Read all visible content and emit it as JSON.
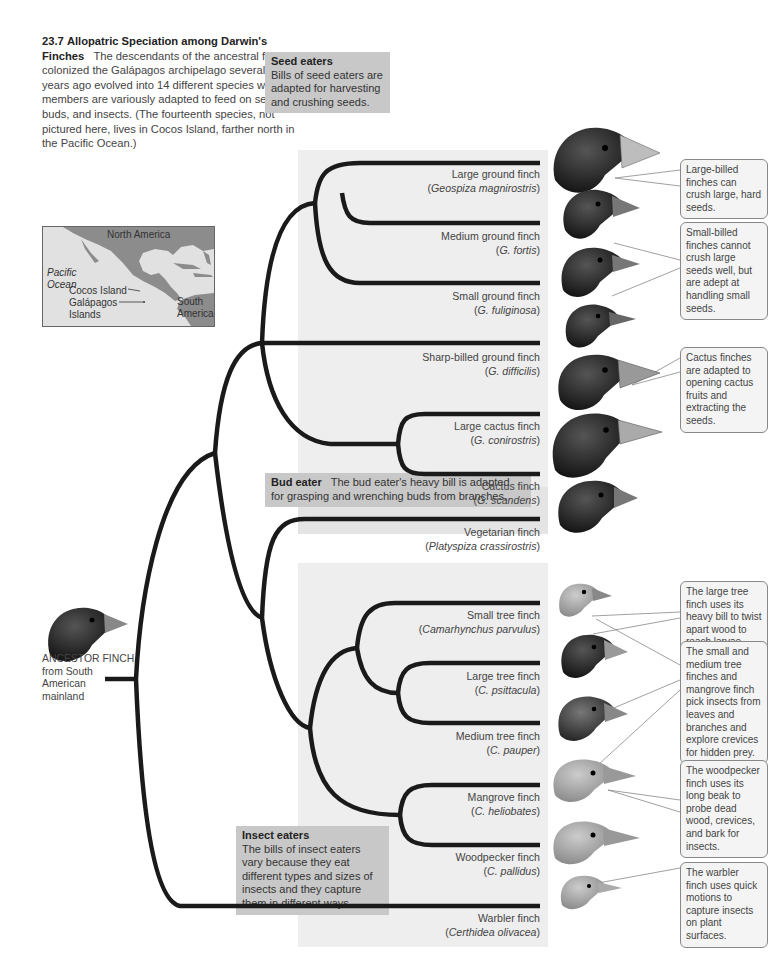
{
  "figure": {
    "number": "23.7",
    "title": "Allopatric Speciation among Darwin's Finches",
    "caption": "The descendants of the ancestral finch that colonized the Galápagos archipelago several million years ago evolved into 14 different species whose members are variously adapted to feed on seeds, buds, and insects. (The fourteenth species, not pictured here, lives in Cocos Island, farther north in the Pacific Ocean.)"
  },
  "map": {
    "labels": {
      "north_america": "North America",
      "pacific_ocean_1": "Pacific",
      "pacific_ocean_2": "Ocean",
      "cocos_island": "Cocos Island",
      "galapagos_1": "Galápagos",
      "galapagos_2": "Islands",
      "south_america_1": "South",
      "south_america_2": "America"
    },
    "colors": {
      "land": "#8c8c8c",
      "water": "#e1e1e1"
    }
  },
  "groups": {
    "seed_eaters": {
      "title": "Seed eaters",
      "text": "Bills of seed eaters are adapted for harvesting and crushing seeds."
    },
    "bud_eater": {
      "title": "Bud eater",
      "text": "The bud eater's heavy bill is adapted for grasping and wrenching buds from branches."
    },
    "insect_eaters": {
      "title": "Insect eaters",
      "text": "The bills of insect eaters vary because they eat different types and sizes of insects and they capture them in different ways."
    }
  },
  "ancestor": {
    "line1": "ANCESTOR FINCH",
    "line2": "from South",
    "line3": "American",
    "line4": "mainland"
  },
  "species": [
    {
      "common": "Large ground finch",
      "scientific": "Geospiza magnirostris",
      "diet": "seed"
    },
    {
      "common": "Medium ground finch",
      "scientific": "G. fortis",
      "diet": "seed"
    },
    {
      "common": "Small ground finch",
      "scientific": "G. fuliginosa",
      "diet": "seed"
    },
    {
      "common": "Sharp-billed ground finch",
      "scientific": "G. difficilis",
      "diet": "seed"
    },
    {
      "common": "Large cactus finch",
      "scientific": "G. conirostris",
      "diet": "seed"
    },
    {
      "common": "Cactus finch",
      "scientific": "G. scandens",
      "diet": "seed"
    },
    {
      "common": "Vegetarian finch",
      "scientific": "Platyspiza crassirostris",
      "diet": "bud"
    },
    {
      "common": "Small tree finch",
      "scientific": "Camarhynchus parvulus",
      "diet": "insect"
    },
    {
      "common": "Large tree finch",
      "scientific": "C. psittacula",
      "diet": "insect"
    },
    {
      "common": "Medium tree finch",
      "scientific": "C. pauper",
      "diet": "insect"
    },
    {
      "common": "Mangrove finch",
      "scientific": "C. heliobates",
      "diet": "insect"
    },
    {
      "common": "Woodpecker finch",
      "scientific": "C. pallidus",
      "diet": "insect"
    },
    {
      "common": "Warbler finch",
      "scientific": "Certhidea olivacea",
      "diet": "insect"
    }
  ],
  "notes": [
    {
      "text": "Large-billed finches can crush large, hard seeds."
    },
    {
      "text": "Small-billed finches cannot crush large seeds well, but are adept at handling small seeds."
    },
    {
      "text": "Cactus finches are adapted to opening cactus fruits and extracting the seeds."
    },
    {
      "text": "The large tree finch uses its heavy bill to twist apart wood to reach larvae inside."
    },
    {
      "text": "The small and medium tree finches and mangrove finch pick insects from leaves and branches and explore crevices for hidden prey."
    },
    {
      "text": "The woodpecker finch uses its long beak to probe dead wood, crevices, and bark for insects."
    },
    {
      "text": "The warbler finch uses quick motions to capture insects on plant surfaces."
    }
  ],
  "colors": {
    "branch": "#1a1a1a",
    "panel": "#eeeeee",
    "label_box": "#c8c8c8",
    "dark_finch": "#222222",
    "light_finch": "#a8a8a8"
  }
}
